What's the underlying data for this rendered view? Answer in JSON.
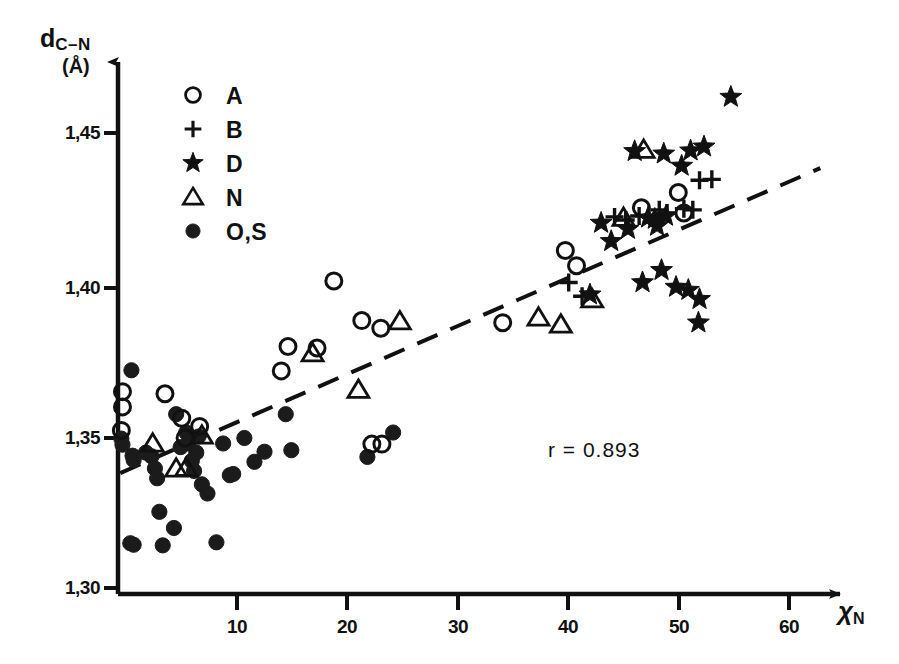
{
  "axes": {
    "y_title_main": "d",
    "y_title_sub": "C–N",
    "y_unit": "(Å)",
    "x_title_main": "χ",
    "x_title_sub": "N",
    "y_ticks": [
      {
        "label": "1,45",
        "value": 1.45
      },
      {
        "label": "1,40",
        "value": 1.4
      },
      {
        "label": "1,35",
        "value": 1.35
      },
      {
        "label": "1,30",
        "value": 1.3
      }
    ],
    "x_ticks": [
      {
        "label": "10",
        "value": 10
      },
      {
        "label": "20",
        "value": 20
      },
      {
        "label": "30",
        "value": 30
      },
      {
        "label": "40",
        "value": 40
      },
      {
        "label": "50",
        "value": 50
      },
      {
        "label": "60",
        "value": 60
      }
    ]
  },
  "legend": {
    "items": [
      {
        "symbol": "open-circle",
        "label": "A"
      },
      {
        "symbol": "plus",
        "label": "B"
      },
      {
        "symbol": "star",
        "label": "D"
      },
      {
        "symbol": "open-triangle",
        "label": "N"
      },
      {
        "symbol": "filled-circle",
        "label": "O,S"
      }
    ]
  },
  "annotation": {
    "r_label": "r =  0.893"
  },
  "chart_data": {
    "type": "scatter",
    "title": "",
    "xlabel": "χN",
    "ylabel": "dC-N (Å)",
    "xlim": [
      0,
      63
    ],
    "ylim": [
      1.3,
      1.472
    ],
    "grid": false,
    "legend_position": "top-left",
    "correlation_r": 0.893,
    "trendline": {
      "style": "dashed",
      "x_start": 0.2,
      "y_start": 1.3385,
      "x_end": 62.8,
      "y_end": 1.4385
    },
    "series": [
      {
        "name": "A",
        "symbol": "open-circle",
        "points": [
          [
            0.4,
            1.3652
          ],
          [
            0.4,
            1.3602
          ],
          [
            0.3,
            1.3525
          ],
          [
            4.2,
            1.3645
          ],
          [
            5.7,
            1.3565
          ],
          [
            6.0,
            1.35
          ],
          [
            7.3,
            1.3538
          ],
          [
            14.6,
            1.372
          ],
          [
            15.2,
            1.38
          ],
          [
            17.8,
            1.3795
          ],
          [
            19.3,
            1.4015
          ],
          [
            21.8,
            1.3885
          ],
          [
            23.5,
            1.386
          ],
          [
            34.4,
            1.3878
          ],
          [
            40.0,
            1.4115
          ],
          [
            41.0,
            1.4065
          ],
          [
            46.8,
            1.4255
          ],
          [
            50.1,
            1.4305
          ],
          [
            50.6,
            1.4238
          ],
          [
            22.7,
            1.348
          ],
          [
            23.6,
            1.348
          ]
        ]
      },
      {
        "name": "B",
        "symbol": "plus",
        "points": [
          [
            40.3,
            1.401
          ],
          [
            41.5,
            1.3965
          ],
          [
            46.6,
            1.4228
          ],
          [
            48.4,
            1.4248
          ],
          [
            49.1,
            1.4238
          ],
          [
            50.6,
            1.4252
          ],
          [
            51.4,
            1.4248
          ],
          [
            52.0,
            1.4345
          ],
          [
            53.1,
            1.4348
          ],
          [
            44.4,
            1.4225
          ],
          [
            45.4,
            1.4215
          ]
        ]
      },
      {
        "name": "D",
        "symbol": "star",
        "points": [
          [
            54.8,
            1.4618
          ],
          [
            46.2,
            1.444
          ],
          [
            48.8,
            1.4432
          ],
          [
            51.2,
            1.4442
          ],
          [
            52.4,
            1.4455
          ],
          [
            50.4,
            1.4392
          ],
          [
            43.2,
            1.4205
          ],
          [
            44.1,
            1.4145
          ],
          [
            45.6,
            1.4185
          ],
          [
            47.4,
            1.4222
          ],
          [
            48.2,
            1.4195
          ],
          [
            46.9,
            1.401
          ],
          [
            48.6,
            1.405
          ],
          [
            49.9,
            1.3995
          ],
          [
            51.0,
            1.3985
          ],
          [
            52.0,
            1.3955
          ],
          [
            51.9,
            1.3878
          ],
          [
            42.2,
            1.397
          ],
          [
            48.0,
            1.4218
          ],
          [
            49.0,
            1.4228
          ]
        ]
      },
      {
        "name": "N",
        "symbol": "open-triangle",
        "points": [
          [
            3.1,
            1.3482
          ],
          [
            5.2,
            1.34
          ],
          [
            6.1,
            1.3402
          ],
          [
            7.5,
            1.3508
          ],
          [
            17.4,
            1.3778
          ],
          [
            21.5,
            1.3658
          ],
          [
            25.2,
            1.3883
          ],
          [
            37.6,
            1.3895
          ],
          [
            39.6,
            1.3872
          ],
          [
            42.4,
            1.3955
          ],
          [
            45.2,
            1.4222
          ],
          [
            47.0,
            1.4445
          ]
        ]
      },
      {
        "name": "O,S",
        "symbol": "filled-circle",
        "points": [
          [
            0.3,
            1.3498
          ],
          [
            0.4,
            1.3478
          ],
          [
            1.2,
            1.3722
          ],
          [
            1.3,
            1.3442
          ],
          [
            1.4,
            1.3428
          ],
          [
            1.1,
            1.3155
          ],
          [
            1.4,
            1.315
          ],
          [
            2.5,
            1.3452
          ],
          [
            3.0,
            1.344
          ],
          [
            3.3,
            1.34
          ],
          [
            3.5,
            1.3368
          ],
          [
            3.7,
            1.3258
          ],
          [
            4.0,
            1.3148
          ],
          [
            5.2,
            1.3578
          ],
          [
            5.6,
            1.347
          ],
          [
            6.1,
            1.3518
          ],
          [
            6.3,
            1.3482
          ],
          [
            6.6,
            1.3425
          ],
          [
            6.8,
            1.3392
          ],
          [
            7.0,
            1.3452
          ],
          [
            7.2,
            1.3505
          ],
          [
            7.5,
            1.3348
          ],
          [
            8.0,
            1.3318
          ],
          [
            9.4,
            1.3482
          ],
          [
            10.0,
            1.3378
          ],
          [
            10.3,
            1.3382
          ],
          [
            11.3,
            1.35
          ],
          [
            12.2,
            1.3422
          ],
          [
            13.1,
            1.3455
          ],
          [
            15.0,
            1.3578
          ],
          [
            15.5,
            1.346
          ],
          [
            22.3,
            1.3438
          ],
          [
            24.6,
            1.3518
          ],
          [
            8.8,
            1.3158
          ],
          [
            5.0,
            1.3205
          ]
        ]
      }
    ]
  }
}
